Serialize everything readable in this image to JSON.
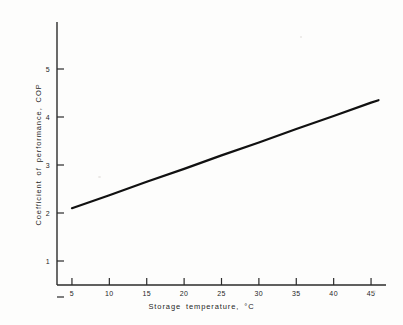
{
  "chart_data": {
    "type": "line",
    "title": "",
    "xlabel": "Storage temperature,  °C",
    "ylabel": "Coefficient of performance,   COP",
    "xlim": [
      3,
      47
    ],
    "ylim": [
      0,
      5
    ],
    "grid": false,
    "legend": null,
    "x_ticks": [
      5,
      10,
      15,
      20,
      25,
      30,
      35,
      40,
      45
    ],
    "x_tick_labels": [
      "5",
      "10",
      "15",
      "20",
      "25",
      "30",
      "35",
      "40",
      "45"
    ],
    "y_ticks": [
      1,
      2,
      3,
      4,
      5
    ],
    "y_tick_labels": [
      "1",
      "2",
      "3",
      "4",
      "5"
    ],
    "series": [
      {
        "name": "COP vs storage temperature",
        "color": "#111111",
        "line_width": 2.2,
        "x": [
          5,
          10,
          15,
          20,
          25,
          30,
          35,
          40,
          45,
          46
        ],
        "values": [
          2.1,
          2.37,
          2.65,
          2.92,
          3.2,
          3.47,
          3.75,
          4.02,
          4.3,
          4.35
        ]
      }
    ],
    "annotations": []
  },
  "figure": {
    "background_color": "#fdfdfc",
    "axis_color": "#2b2b2b",
    "text_color": "#1f1f1f"
  }
}
